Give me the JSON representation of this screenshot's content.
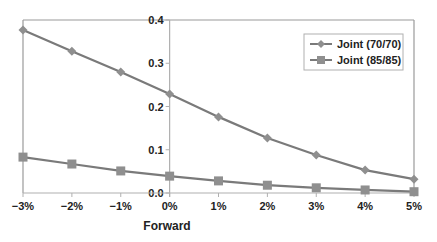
{
  "chart_data": {
    "type": "line",
    "title": "",
    "xlabel": "Forward",
    "ylabel": "",
    "categories": [
      "-3%",
      "-2%",
      "-1%",
      "0%",
      "1%",
      "2%",
      "3%",
      "4%",
      "5%"
    ],
    "x_tick_labels": [
      "−3%",
      "−2%",
      "−1%",
      "0%",
      "1%",
      "2%",
      "3%",
      "4%",
      "5%"
    ],
    "y_ticks": [
      0.0,
      0.1,
      0.2,
      0.3,
      0.4
    ],
    "y_tick_labels": [
      "0.0",
      "0.1",
      "0.2",
      "0.3",
      "0.4"
    ],
    "ylim": [
      0,
      0.4
    ],
    "grid": false,
    "y_axis_position": "at x = 0%",
    "legend_position": "upper right (inside plot)",
    "series": [
      {
        "name": "Joint (70/70)",
        "marker": "diamond",
        "values": [
          0.377,
          0.328,
          0.28,
          0.229,
          0.176,
          0.127,
          0.088,
          0.053,
          0.032
        ]
      },
      {
        "name": "Joint (85/85)",
        "marker": "square",
        "values": [
          0.083,
          0.067,
          0.051,
          0.039,
          0.028,
          0.018,
          0.012,
          0.007,
          0.003
        ]
      }
    ],
    "colors": {
      "line": "#7a7a7a",
      "marker": "#8f8f8f",
      "frame": "#9a9a9a",
      "axis": "#b0b0b0",
      "text": "#222222"
    }
  }
}
